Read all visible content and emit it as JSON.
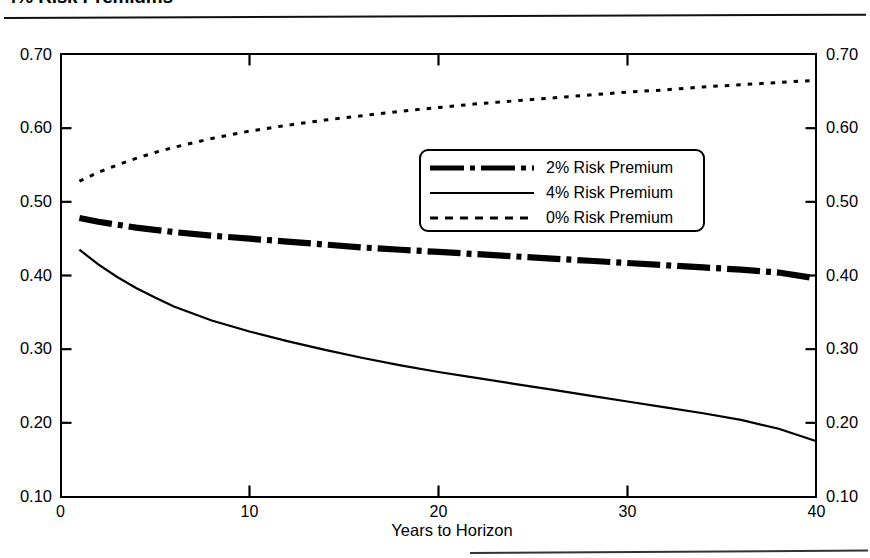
{
  "title": "4% Risk Premiums",
  "axis": {
    "x_title": "Years to Horizon",
    "x_ticks": [
      "0",
      "10",
      "20",
      "30",
      "40"
    ],
    "y_ticks_left": [
      "0.70",
      "0.60",
      "0.50",
      "0.40",
      "0.30",
      "0.20",
      "0.10"
    ],
    "y_ticks_right": [
      "0.70",
      "0.60",
      "0.50",
      "0.40",
      "0.30",
      "0.20",
      "0.10"
    ]
  },
  "legend": {
    "position": "inside-upper-center",
    "items": [
      {
        "label": "2% Risk Premium",
        "style": "thick-dash-dot",
        "swatch": "sw-thick-dashdot",
        "color": "#000000"
      },
      {
        "label": "4% Risk Premium",
        "style": "thin-solid",
        "swatch": "sw-thin-solid",
        "color": "#000000"
      },
      {
        "label": "0% Risk Premium",
        "style": "dotted",
        "swatch": "sw-dotted",
        "color": "#000000"
      }
    ]
  },
  "chart_data": {
    "type": "line",
    "title": "4% Risk Premiums",
    "xlabel": "Years to Horizon",
    "ylabel": "",
    "xlim": [
      0,
      40
    ],
    "ylim": [
      0.1,
      0.7
    ],
    "grid": false,
    "legend_position": "inside-upper-center",
    "x": [
      1,
      2,
      3,
      4,
      5,
      6,
      8,
      10,
      12,
      14,
      16,
      18,
      20,
      22,
      24,
      26,
      28,
      30,
      32,
      34,
      36,
      38,
      40
    ],
    "series": [
      {
        "name": "0% Risk Premium",
        "style": "dotted",
        "color": "#000000",
        "values": [
          0.528,
          0.54,
          0.55,
          0.559,
          0.567,
          0.574,
          0.586,
          0.596,
          0.604,
          0.611,
          0.617,
          0.623,
          0.628,
          0.633,
          0.637,
          0.641,
          0.645,
          0.649,
          0.652,
          0.656,
          0.659,
          0.662,
          0.665
        ]
      },
      {
        "name": "2% Risk Premium",
        "style": "thick-dash-dot",
        "color": "#000000",
        "values": [
          0.478,
          0.473,
          0.469,
          0.465,
          0.462,
          0.459,
          0.454,
          0.45,
          0.446,
          0.442,
          0.438,
          0.435,
          0.432,
          0.429,
          0.426,
          0.423,
          0.42,
          0.417,
          0.414,
          0.411,
          0.408,
          0.404,
          0.396
        ]
      },
      {
        "name": "4% Risk Premium",
        "style": "thin-solid",
        "color": "#000000",
        "values": [
          0.435,
          0.415,
          0.398,
          0.383,
          0.37,
          0.358,
          0.339,
          0.324,
          0.311,
          0.299,
          0.288,
          0.278,
          0.269,
          0.261,
          0.253,
          0.245,
          0.237,
          0.229,
          0.221,
          0.213,
          0.204,
          0.192,
          0.175
        ]
      }
    ]
  }
}
